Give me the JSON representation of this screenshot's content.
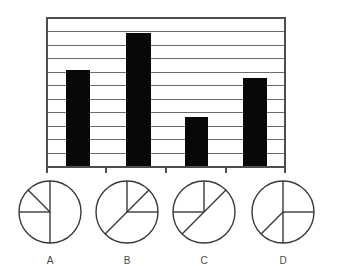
{
  "chart_data": [
    {
      "type": "bar",
      "title": "",
      "xlabel": "",
      "ylabel": "",
      "categories": [
        "A",
        "B",
        "C",
        "D"
      ],
      "values": [
        7,
        9.5,
        4,
        6.5
      ],
      "ylim": [
        0,
        11
      ],
      "grid": true,
      "gridlines": 11,
      "legend": "none",
      "bar_color": "#080808",
      "series": [
        {
          "name": "bars",
          "values": [
            7,
            9.5,
            4,
            6.5
          ]
        }
      ]
    },
    {
      "type": "pie",
      "title": "A",
      "slices": [
        {
          "label": "",
          "value": 25,
          "start_deg": 90,
          "end_deg": 135
        },
        {
          "label": "",
          "value": 25,
          "start_deg": 135,
          "end_deg": 180
        },
        {
          "label": "",
          "value": 25,
          "start_deg": 180,
          "end_deg": 270
        },
        {
          "label": "",
          "value": 50,
          "start_deg": 270,
          "end_deg": 450
        }
      ],
      "spokes_deg": [
        90,
        135,
        180,
        270
      ]
    },
    {
      "type": "pie",
      "title": "B",
      "slices": [
        {
          "label": "",
          "value": 12.5,
          "start_deg": 45,
          "end_deg": 90
        },
        {
          "label": "",
          "value": 37.5,
          "start_deg": 225,
          "end_deg": 360
        },
        {
          "label": "",
          "value": 12.5,
          "start_deg": 0,
          "end_deg": 45
        },
        {
          "label": "",
          "value": 37.5,
          "start_deg": 90,
          "end_deg": 225
        }
      ],
      "spokes_deg": [
        0,
        45,
        90,
        225
      ]
    },
    {
      "type": "pie",
      "title": "C",
      "slices": [
        {
          "label": "",
          "value": 12.5,
          "start_deg": 45,
          "end_deg": 90
        },
        {
          "label": "",
          "value": 25,
          "start_deg": 90,
          "end_deg": 180
        },
        {
          "label": "",
          "value": 12.5,
          "start_deg": 180,
          "end_deg": 225
        },
        {
          "label": "",
          "value": 50,
          "start_deg": 225,
          "end_deg": 405
        }
      ],
      "spokes_deg": [
        45,
        90,
        180,
        225
      ]
    },
    {
      "type": "pie",
      "title": "D",
      "slices": [
        {
          "label": "",
          "value": 25,
          "start_deg": 0,
          "end_deg": 90
        },
        {
          "label": "",
          "value": 37.5,
          "start_deg": 90,
          "end_deg": 225
        },
        {
          "label": "",
          "value": 12.5,
          "start_deg": 225,
          "end_deg": 270
        },
        {
          "label": "",
          "value": 25,
          "start_deg": 270,
          "end_deg": 360
        }
      ],
      "spokes_deg": [
        0,
        90,
        225,
        270
      ]
    }
  ],
  "figure": {
    "background": "#ffffff",
    "bar_chart": {
      "plot_left": 47,
      "plot_right": 285,
      "plot_top": 18,
      "plot_bottom": 167,
      "gridline_color": "#6b6b6b",
      "frame_color": "#4d4d4d",
      "bar_color": "#080808",
      "bars": [
        {
          "name": "bar-a",
          "x": 66,
          "width": 24,
          "top": 70
        },
        {
          "name": "bar-b",
          "x": 126,
          "width": 25,
          "top": 33
        },
        {
          "name": "bar-c",
          "x": 185,
          "width": 23,
          "top": 117
        },
        {
          "name": "bar-d",
          "x": 243,
          "width": 24,
          "top": 78
        }
      ],
      "ticks_x": [
        47,
        106,
        166,
        226,
        285
      ]
    },
    "pies": [
      {
        "name": "pie-a",
        "cx": 50,
        "cy": 212,
        "r": 31,
        "label": "A",
        "label_x": 50,
        "label_y": 264,
        "spokes": [
          90,
          135,
          180,
          270
        ]
      },
      {
        "name": "pie-b",
        "cx": 127,
        "cy": 212,
        "r": 31,
        "label": "B",
        "label_x": 127,
        "label_y": 264,
        "spokes": [
          0,
          45,
          90,
          225
        ]
      },
      {
        "name": "pie-c",
        "cx": 204,
        "cy": 212,
        "r": 31,
        "label": "C",
        "label_x": 204,
        "label_y": 264,
        "spokes": [
          45,
          90,
          180,
          225
        ]
      },
      {
        "name": "pie-d",
        "cx": 283,
        "cy": 212,
        "r": 31,
        "label": "D",
        "label_x": 283,
        "label_y": 264,
        "spokes": [
          0,
          90,
          225,
          270
        ]
      }
    ]
  }
}
